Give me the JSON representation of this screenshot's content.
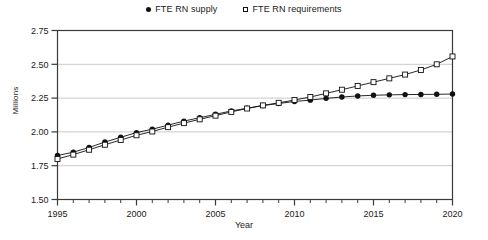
{
  "chart_data": {
    "type": "line",
    "title": "",
    "xlabel": "Year",
    "ylabel": "Millions",
    "xlim": [
      1995,
      2020
    ],
    "ylim": [
      1.5,
      2.75
    ],
    "yticks": [
      1.5,
      1.75,
      2.0,
      2.25,
      2.5,
      2.75
    ],
    "ytick_labels": [
      "1.50",
      "1.75",
      "2.00",
      "2.25",
      "2.50",
      "2.75"
    ],
    "xticks": [
      1995,
      2000,
      2005,
      2010,
      2015,
      2020
    ],
    "xtick_labels": [
      "1995",
      "2000",
      "2005",
      "2010",
      "2015",
      "2020"
    ],
    "minor_xtick_interval": 1,
    "grid": "horizontal",
    "legend_position": "top-center",
    "x": [
      1995,
      1996,
      1997,
      1998,
      1999,
      2000,
      2001,
      2002,
      2003,
      2004,
      2005,
      2006,
      2007,
      2008,
      2009,
      2010,
      2011,
      2012,
      2013,
      2014,
      2015,
      2016,
      2017,
      2018,
      2019,
      2020
    ],
    "series": [
      {
        "name": "FTE RN supply",
        "marker": "filled-circle",
        "color": "#111111",
        "values": [
          1.825,
          1.85,
          1.885,
          1.925,
          1.96,
          1.995,
          2.02,
          2.05,
          2.08,
          2.105,
          2.13,
          2.155,
          2.175,
          2.195,
          2.21,
          2.225,
          2.235,
          2.248,
          2.258,
          2.266,
          2.271,
          2.274,
          2.276,
          2.277,
          2.278,
          2.28
        ]
      },
      {
        "name": "FTE RN requirements",
        "marker": "open-square",
        "color": "#111111",
        "values": [
          1.8,
          1.832,
          1.868,
          1.905,
          1.94,
          1.975,
          2.003,
          2.035,
          2.065,
          2.093,
          2.12,
          2.148,
          2.173,
          2.196,
          2.215,
          2.236,
          2.258,
          2.285,
          2.312,
          2.34,
          2.368,
          2.396,
          2.424,
          2.458,
          2.5,
          2.558
        ]
      }
    ]
  },
  "legend": {
    "items": [
      {
        "label": "FTE RN supply",
        "marker": "filled-circle"
      },
      {
        "label": "FTE RN requirements",
        "marker": "open-square"
      }
    ]
  }
}
